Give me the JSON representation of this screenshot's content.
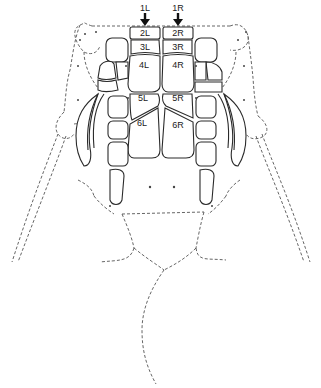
{
  "figure": {
    "type": "anatomical-diagram",
    "arrows": [
      {
        "label": "1L",
        "side": "left"
      },
      {
        "label": "1R",
        "side": "right"
      }
    ],
    "plates": {
      "left": [
        "2L",
        "3L",
        "4L",
        "5L",
        "6L"
      ],
      "right": [
        "2R",
        "3R",
        "4R",
        "5R",
        "6R"
      ]
    },
    "colors": {
      "line": "#2a2a2a",
      "dashed": "#555555",
      "background": "#ffffff"
    }
  }
}
